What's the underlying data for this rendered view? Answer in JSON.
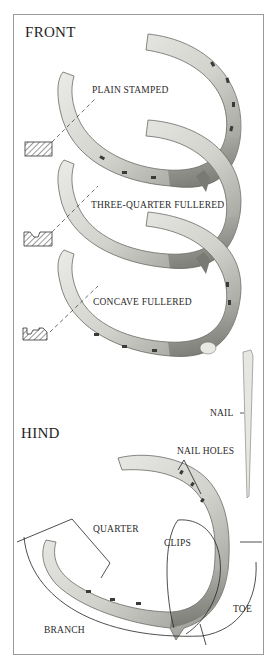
{
  "diagram": {
    "sections": {
      "front": {
        "title": "FRONT"
      },
      "hind": {
        "title": "HIND"
      }
    },
    "front_shoes": [
      {
        "id": "plain-stamped",
        "label": "PLAIN STAMPED",
        "cross_section": "solid rectangle"
      },
      {
        "id": "three-quarter-fullered",
        "label": "THREE-QUARTER FULLERED",
        "cross_section": "rectangle with groove"
      },
      {
        "id": "concave-fullered",
        "label": "CONCAVE FULLERED",
        "cross_section": "concave with groove"
      }
    ],
    "nail": {
      "label": "NAIL"
    },
    "hind_parts": {
      "nail_holes": "NAIL HOLES",
      "quarter": "QUARTER",
      "clips": "CLIPS",
      "toe": "TOE",
      "branch": "BRANCH"
    },
    "colors": {
      "background": "#ffffff",
      "frame": "#9a9a9a",
      "steel_light": "#e6e6e2",
      "steel_mid": "#b9b9b4",
      "steel_dark": "#6f6f6a",
      "ink": "#222222"
    }
  }
}
